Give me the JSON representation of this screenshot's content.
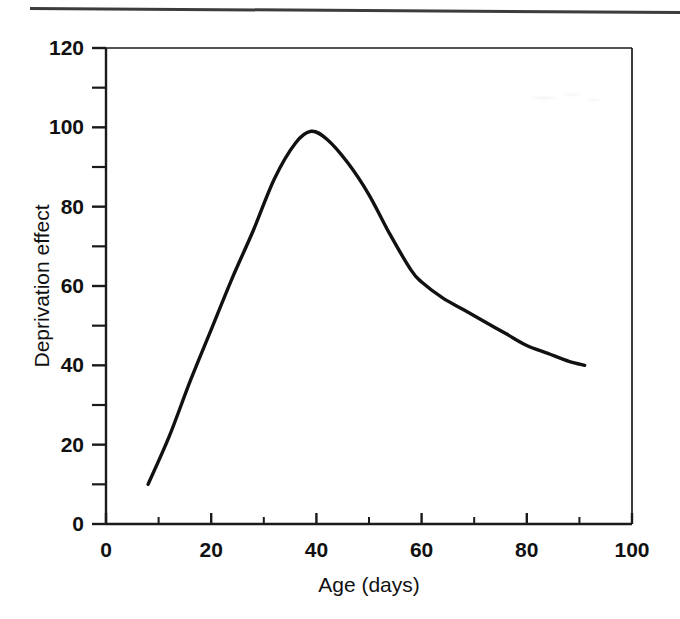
{
  "figure": {
    "background_color": "#ffffff",
    "line_color": "#111111",
    "axis_color": "#1a1a1a"
  },
  "chart_data": {
    "type": "line",
    "title": "",
    "subtitle": "",
    "xlabel": "Age (days)",
    "ylabel": "Deprivation effect",
    "xlim": [
      0,
      100
    ],
    "ylim": [
      0,
      120
    ],
    "grid": false,
    "legend": null,
    "x_ticks": [
      0,
      20,
      40,
      60,
      80,
      100
    ],
    "x_tick_labels": [
      "0",
      "20",
      "40",
      "60",
      "80",
      "100"
    ],
    "x_minor_ticks": [
      10,
      30,
      50,
      70,
      90
    ],
    "y_ticks": [
      0,
      20,
      40,
      60,
      80,
      100,
      120
    ],
    "y_tick_labels": [
      "0",
      "20",
      "40",
      "60",
      "80",
      "100",
      "120"
    ],
    "y_minor_ticks": [
      10,
      30,
      50,
      70,
      90,
      110
    ],
    "series": [
      {
        "name": "Deprivation effect",
        "color": "#111111",
        "x": [
          8,
          12,
          16,
          20,
          24,
          28,
          32,
          36,
          39,
          42,
          46,
          50,
          54,
          58,
          60,
          64,
          68,
          72,
          76,
          80,
          84,
          88,
          91
        ],
        "values": [
          10,
          22,
          36,
          49,
          62,
          74,
          87,
          96,
          99,
          97,
          91,
          83,
          73,
          64,
          61,
          57,
          54,
          51,
          48,
          45,
          43,
          41,
          40
        ]
      }
    ],
    "annotations": {
      "peak_x": 39,
      "peak_y": 99,
      "start_x": 8,
      "start_y": 10,
      "end_x": 91,
      "end_y": 40
    }
  },
  "axes_geometry": {
    "left_px": 106,
    "right_px": 632,
    "top_px": 48,
    "bottom_px": 524
  }
}
